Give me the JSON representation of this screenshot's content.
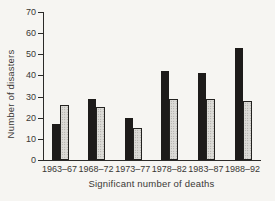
{
  "colors": {
    "background": "#f6f5f2",
    "axis": "#2b2a28",
    "text": "#3a3835",
    "solid_bar": "#1d1b1a",
    "stippled_bar_fill": "#dcdbd7",
    "stippled_bar_dot": "#96948f",
    "stippled_bar_outline": "#232220"
  },
  "chart_data": {
    "type": "bar",
    "title": "",
    "xlabel": "Significant number of deaths",
    "ylabel": "Number of disasters",
    "categories": [
      "1963–67",
      "1968–72",
      "1973–77",
      "1978–82",
      "1983–87",
      "1988–92"
    ],
    "series": [
      {
        "name": "solid-black-bars",
        "style": "solid",
        "values": [
          17,
          29,
          20,
          42,
          41,
          53
        ]
      },
      {
        "name": "stippled-grey-bars",
        "style": "stippled",
        "values": [
          26,
          25,
          15,
          29,
          29,
          28
        ]
      }
    ],
    "ylim": [
      0,
      70
    ],
    "yticks": [
      0,
      10,
      20,
      30,
      40,
      50,
      60,
      70
    ],
    "grid": false,
    "legend": "none"
  }
}
